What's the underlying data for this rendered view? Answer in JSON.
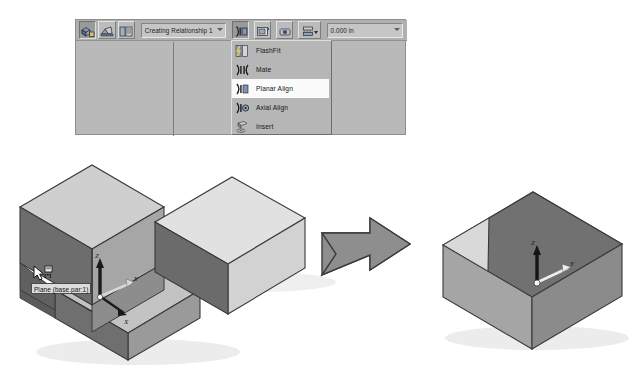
{
  "app": {
    "context": "Solid Edge assembly relationship command bar",
    "panel_title": "Assemble command bar"
  },
  "toolbar": {
    "buttons": [
      {
        "name": "assemble-tool-button",
        "icon": "assemble-icon",
        "state": "pressed",
        "tooltip": "Assemble"
      },
      {
        "name": "reduced-steps-button",
        "icon": "reduced-steps-icon",
        "state": "normal",
        "tooltip": "Reduced Steps"
      },
      {
        "name": "options-button",
        "icon": "assembly-options-icon",
        "state": "normal",
        "tooltip": "Options"
      }
    ],
    "relationship_combo": {
      "name": "relationship-step-combo",
      "value": "Creating Relationship 1",
      "placeholder": "Creating Relationship 1"
    },
    "right_buttons": [
      {
        "name": "relationship-type-button",
        "icon": "planar-align-icon",
        "state": "pressed",
        "tooltip": "Relationship Types"
      },
      {
        "name": "flip-button",
        "icon": "flip-icon",
        "state": "normal",
        "tooltip": "Flip"
      },
      {
        "name": "lock-rotation-button",
        "icon": "lock-rotation-icon",
        "state": "normal",
        "tooltip": "Lock Rotation"
      },
      {
        "name": "offset-type-button",
        "icon": "offset-type-icon",
        "state": "normal",
        "tooltip": "Offset Type",
        "split": true
      }
    ],
    "offset_combo": {
      "name": "offset-value-combo",
      "value": "0.000 in",
      "placeholder": "0.000 in"
    }
  },
  "relationship_menu": {
    "name": "relationship-type-menu",
    "selected": "Planar Align",
    "items": [
      {
        "label": "FlashFit",
        "icon": "flashfit-icon",
        "selected": false
      },
      {
        "label": "Mate",
        "icon": "mate-icon",
        "selected": false
      },
      {
        "label": "Planar Align",
        "icon": "planar-align-icon",
        "selected": true
      },
      {
        "label": "Axial Align",
        "icon": "axial-align-icon",
        "selected": false
      },
      {
        "label": "Insert",
        "icon": "insert-icon",
        "selected": false
      }
    ]
  },
  "viewport": {
    "tooltip": {
      "name": "plane-tooltip",
      "text": "Plane (base.par:1)"
    },
    "cursor": {
      "name": "select-face-cursor",
      "type": "arrow-with-face-badge"
    },
    "parts": [
      {
        "name": "l-shaped-base-part",
        "label": "base.par:1",
        "description": "L-shaped base block, isometric, selected face highlighted",
        "triad": {
          "z": "Z",
          "y": "Y",
          "x": "X"
        }
      },
      {
        "name": "rectangular-block-part",
        "label": "",
        "description": "Rectangular block to be placed, light shaded"
      },
      {
        "name": "assembled-result-part",
        "label": "",
        "description": "Resulting assembled block after Planar Align",
        "triad": {
          "z": "Z",
          "y": "Y",
          "x": "X"
        }
      }
    ],
    "flow_arrow": {
      "name": "result-flow-arrow",
      "direction": "right"
    }
  },
  "colors": {
    "panel_bg": "#b9b9b9",
    "toolbar_bg": "#b0b0b0",
    "menu_bg": "#b6b6b6",
    "menu_selected_bg": "#fbfbfb",
    "tooltip_bg": "#dcdcdc",
    "face_top_light": "#d9d9d9",
    "face_front_mid": "#a8a8a8",
    "face_side_dark": "#6f6f6f",
    "selected_face": "#6a6a6a",
    "arrow_fill": "#8e8e8e",
    "outline": "#3a3a3a",
    "shadow": "#e4e4e4",
    "page_bg": "#ffffff"
  }
}
